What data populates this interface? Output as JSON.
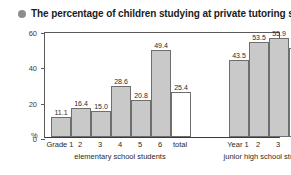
{
  "title": {
    "bullet_icon": "bullet-circle-icon",
    "text": "The percentage of children studying at private tutoring schools"
  },
  "axis": {
    "y_label": "%",
    "y_ticks": [
      "0",
      "20",
      "40",
      "60"
    ],
    "y_min": 0,
    "y_max": 60
  },
  "groups": [
    {
      "caption": "elementary school students",
      "bars": [
        {
          "label": "Grade 1",
          "value": 11.1,
          "value_text": "11.1",
          "kind": "data"
        },
        {
          "label": "2",
          "value": 16.4,
          "value_text": "16.4",
          "kind": "data"
        },
        {
          "label": "3",
          "value": 15.0,
          "value_text": "15.0",
          "kind": "data"
        },
        {
          "label": "4",
          "value": 28.6,
          "value_text": "28.6",
          "kind": "data"
        },
        {
          "label": "5",
          "value": 20.8,
          "value_text": "20.8",
          "kind": "data"
        },
        {
          "label": "6",
          "value": 49.4,
          "value_text": "49.4",
          "kind": "data"
        },
        {
          "label": "total",
          "value": 25.4,
          "value_text": "25.4",
          "kind": "total"
        }
      ]
    },
    {
      "caption": "junior high school students",
      "bars": [
        {
          "label": "Year 1",
          "value": 43.5,
          "value_text": "43.5",
          "kind": "data"
        },
        {
          "label": "2",
          "value": 53.5,
          "value_text": "53.5",
          "kind": "data"
        },
        {
          "label": "3",
          "value": 55.9,
          "value_text": "55.9",
          "kind": "data"
        },
        {
          "label": "total",
          "value": 50.2,
          "value_text": "50.2",
          "kind": "total"
        }
      ]
    }
  ],
  "colors": {
    "bar_fill": "#c9c9c9",
    "bar_stroke": "#6e6e6e",
    "total_fill": "#ffffff",
    "axis": "#5a5a5a",
    "bullet": "#8d8d8d"
  },
  "chart_data": {
    "type": "bar",
    "title": "The percentage of children studying at private tutoring schools",
    "xlabel": "",
    "ylabel": "%",
    "ylim": [
      0,
      60
    ],
    "yticks": [
      0,
      20,
      40,
      60
    ],
    "grid": false,
    "legend": "none",
    "categories": [
      "Grade 1",
      "2",
      "3",
      "4",
      "5",
      "6",
      "total",
      "Year 1",
      "2",
      "3",
      "total"
    ],
    "values": [
      11.1,
      16.4,
      15.0,
      28.6,
      20.8,
      49.4,
      25.4,
      43.5,
      53.5,
      55.9,
      50.2
    ],
    "group_labels": [
      "elementary school students",
      "junior high school students"
    ],
    "groups": [
      {
        "name": "elementary school students",
        "categories": [
          "Grade 1",
          "2",
          "3",
          "4",
          "5",
          "6",
          "total"
        ],
        "values": [
          11.1,
          16.4,
          15.0,
          28.6,
          20.8,
          49.4,
          25.4
        ]
      },
      {
        "name": "junior high school students",
        "categories": [
          "Year 1",
          "2",
          "3",
          "total"
        ],
        "values": [
          43.5,
          53.5,
          55.9,
          50.2
        ]
      }
    ],
    "annotations": [
      "total bars are drawn unfilled (white)"
    ]
  }
}
